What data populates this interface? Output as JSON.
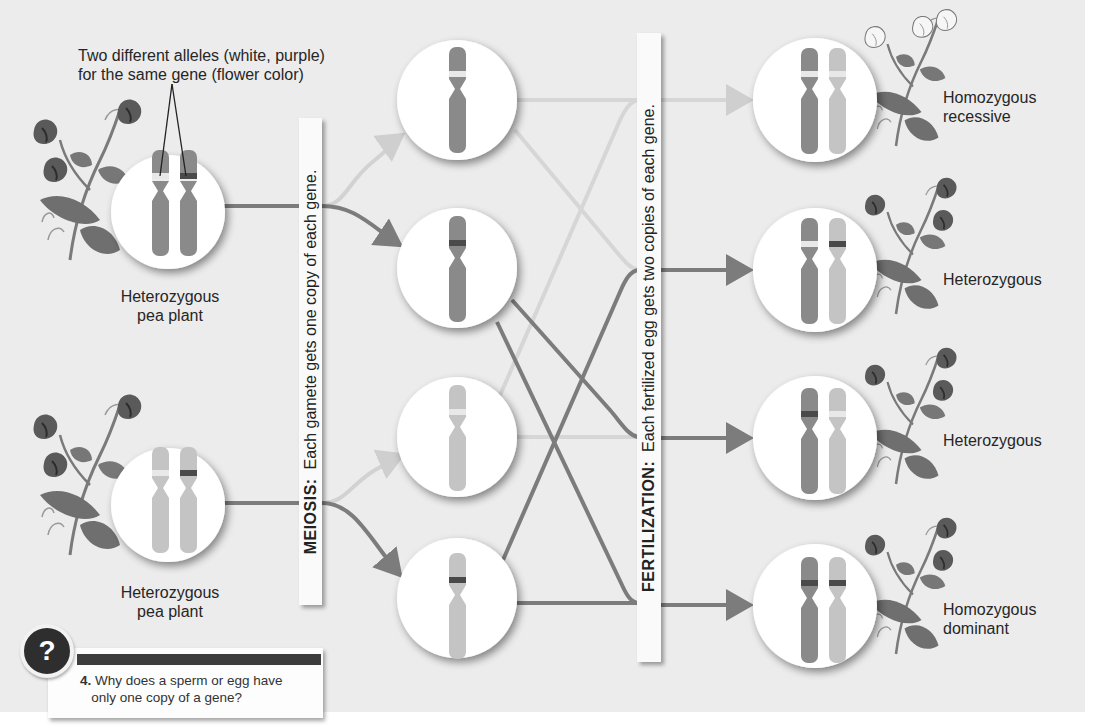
{
  "colors": {
    "background": "#ececec",
    "dominant_chromosome": "#8a8a8a",
    "recessive_chromosome": "#c4c4c4",
    "dark_band": "#4a4a4a",
    "light_band": "#e6e6e6",
    "dominant_line": "#7c7c7c",
    "recessive_line": "#cfcfcf"
  },
  "annotation": {
    "line1": "Two different alleles (white, purple)",
    "line2": "for the same gene (flower color)"
  },
  "parents": [
    {
      "label_line1": "Heterozygous",
      "label_line2": "pea plant",
      "icon": "pea-plant-purple-flowers"
    },
    {
      "label_line1": "Heterozygous",
      "label_line2": "pea plant",
      "icon": "pea-plant-purple-flowers"
    }
  ],
  "meiosis": {
    "title": "MEIOSIS:",
    "text": "Each gamete gets one copy of each gene."
  },
  "gametes": [
    {
      "chromosome": "dominant-shade",
      "allele": "white"
    },
    {
      "chromosome": "dominant-shade",
      "allele": "purple"
    },
    {
      "chromosome": "recessive-shade",
      "allele": "white"
    },
    {
      "chromosome": "recessive-shade",
      "allele": "purple"
    }
  ],
  "fertilization": {
    "title": "FERTILIZATION:",
    "text": "Each fertilized egg gets two copies of each gene."
  },
  "offspring": [
    {
      "label_line1": "Homozygous",
      "label_line2": "recessive",
      "alleles": [
        "white",
        "white"
      ],
      "flower": "white"
    },
    {
      "label_line1": "Heterozygous",
      "label_line2": "",
      "alleles": [
        "white",
        "purple"
      ],
      "flower": "purple"
    },
    {
      "label_line1": "Heterozygous",
      "label_line2": "",
      "alleles": [
        "purple",
        "white"
      ],
      "flower": "purple"
    },
    {
      "label_line1": "Homozygous",
      "label_line2": "dominant",
      "alleles": [
        "purple",
        "purple"
      ],
      "flower": "purple"
    }
  ],
  "question": {
    "icon": "question-mark-icon",
    "symbol": "?",
    "number": "4.",
    "line1": "Why does a sperm or egg have",
    "line2": "only one copy of a gene?"
  }
}
